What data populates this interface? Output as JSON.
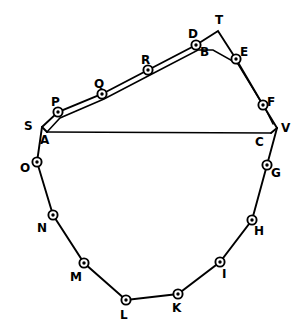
{
  "figure": {
    "width": 303,
    "height": 333,
    "background_color": "#ffffff",
    "line_color": "#000000"
  },
  "chart_data": {
    "type": "scatter",
    "xlabel": "",
    "ylabel": "",
    "grid": false,
    "legend": false,
    "xlim": [
      0,
      303
    ],
    "ylim": [
      0,
      333
    ],
    "note": "Polygon traverse with lettered stations; inner chord A-C drawn across the figure; double (parallel offset) lines run along the upper boundary S-P-Q-R-D-T-E-F-V and the inner boundary A-B-C.",
    "stations": [
      {
        "label": "A",
        "x": 47,
        "y": 132,
        "marker": false,
        "label_dx": -3,
        "label_dy": 8
      },
      {
        "label": "B",
        "x": 213,
        "y": 50,
        "marker": false,
        "label_dx": -9,
        "label_dy": 2
      },
      {
        "label": "C",
        "x": 271,
        "y": 133,
        "marker": false,
        "label_dx": -12,
        "label_dy": 9
      },
      {
        "label": "D",
        "x": 196,
        "y": 45,
        "marker": true,
        "label_dx": -4,
        "label_dy": -11
      },
      {
        "label": "E",
        "x": 236,
        "y": 59,
        "marker": true,
        "label_dx": 8,
        "label_dy": -7
      },
      {
        "label": "F",
        "x": 263,
        "y": 105,
        "marker": true,
        "label_dx": 8,
        "label_dy": -3
      },
      {
        "label": "G",
        "x": 267,
        "y": 165,
        "marker": true,
        "label_dx": 8,
        "label_dy": 8
      },
      {
        "label": "H",
        "x": 252,
        "y": 220,
        "marker": true,
        "label_dx": 6,
        "label_dy": 11
      },
      {
        "label": "I",
        "x": 220,
        "y": 262,
        "marker": true,
        "label_dx": 6,
        "label_dy": 12
      },
      {
        "label": "K",
        "x": 178,
        "y": 294,
        "marker": true,
        "label_dx": -2,
        "label_dy": 14
      },
      {
        "label": "L",
        "x": 126,
        "y": 300,
        "marker": true,
        "label_dx": -2,
        "label_dy": 15
      },
      {
        "label": "M",
        "x": 84,
        "y": 263,
        "marker": true,
        "label_dx": -10,
        "label_dy": 14
      },
      {
        "label": "N",
        "x": 53,
        "y": 215,
        "marker": true,
        "label_dx": -12,
        "label_dy": 13
      },
      {
        "label": "O",
        "x": 37,
        "y": 162,
        "marker": true,
        "label_dx": -13,
        "label_dy": 6
      },
      {
        "label": "P",
        "x": 58,
        "y": 112,
        "marker": true,
        "label_dx": -3,
        "label_dy": -10
      },
      {
        "label": "Q",
        "x": 102,
        "y": 94,
        "marker": true,
        "label_dx": -4,
        "label_dy": -10
      },
      {
        "label": "R",
        "x": 148,
        "y": 70,
        "marker": true,
        "label_dx": -3,
        "label_dy": -10
      },
      {
        "label": "S",
        "x": 42,
        "y": 127,
        "marker": false,
        "label_dx": -14,
        "label_dy": -1
      },
      {
        "label": "T",
        "x": 218,
        "y": 31,
        "marker": false,
        "label_dx": 1,
        "label_dy": -11
      },
      {
        "label": "V",
        "x": 277,
        "y": 128,
        "marker": false,
        "label_dx": 8,
        "label_dy": 0
      }
    ],
    "paths": [
      {
        "name": "outer-upper-boundary",
        "points": [
          [
            42,
            127
          ],
          [
            58,
            112
          ],
          [
            102,
            94
          ],
          [
            148,
            70
          ],
          [
            196,
            45
          ],
          [
            218,
            31
          ],
          [
            236,
            59
          ],
          [
            263,
            105
          ],
          [
            277,
            128
          ]
        ]
      },
      {
        "name": "inner-upper-boundary",
        "points": [
          [
            47,
            132
          ],
          [
            60,
            118
          ],
          [
            104,
            99
          ],
          [
            150,
            75
          ],
          [
            198,
            50
          ],
          [
            213,
            50
          ],
          [
            238,
            64
          ],
          [
            266,
            110
          ],
          [
            273,
            124
          ]
        ]
      },
      {
        "name": "inner-chord-A-C",
        "points": [
          [
            47,
            132
          ],
          [
            271,
            133
          ]
        ]
      },
      {
        "name": "lower-boundary-A-to-C",
        "points": [
          [
            42,
            127
          ],
          [
            37,
            162
          ],
          [
            53,
            215
          ],
          [
            84,
            263
          ],
          [
            126,
            300
          ],
          [
            178,
            294
          ],
          [
            220,
            262
          ],
          [
            252,
            220
          ],
          [
            267,
            165
          ],
          [
            277,
            128
          ]
        ]
      },
      {
        "name": "closure-S-A",
        "points": [
          [
            42,
            127
          ],
          [
            47,
            132
          ]
        ]
      },
      {
        "name": "closure-V-C",
        "points": [
          [
            277,
            128
          ],
          [
            271,
            133
          ]
        ]
      }
    ]
  }
}
